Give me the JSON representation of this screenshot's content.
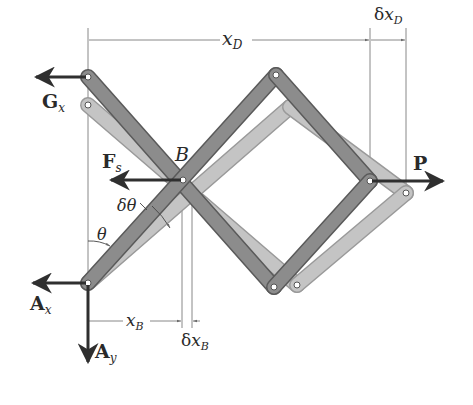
{
  "diagram": {
    "type": "mechanism",
    "colors": {
      "member_dark": "#8c8c8c",
      "member_dark_edge": "#5a5a5a",
      "member_light": "#c4c4c4",
      "member_light_edge": "#9a9a9a",
      "arrow": "#2f2f2f",
      "dim_line": "#6a6a6a"
    },
    "labels": {
      "Gx": {
        "main": "G",
        "sub": "x"
      },
      "Fs": {
        "main": "F",
        "sub": "s"
      },
      "B": "B",
      "P": "P",
      "Ax": {
        "main": "A",
        "sub": "x"
      },
      "Ay": {
        "main": "A",
        "sub": "y"
      },
      "theta": "θ",
      "dtheta": "δθ",
      "xD": {
        "main": "x",
        "sub": "D"
      },
      "dxD": {
        "prefix": "δ",
        "main": "x",
        "sub": "D"
      },
      "xB": {
        "main": "x",
        "sub": "B"
      },
      "dxB": {
        "prefix": "δ",
        "main": "x",
        "sub": "B"
      }
    }
  }
}
